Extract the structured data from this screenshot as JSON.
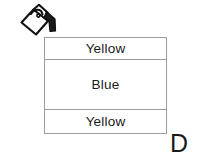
{
  "figure": {
    "label": "D",
    "icon": {
      "name": "paint-bucket-icon",
      "description": "tilted paint bucket pouring"
    },
    "layers": [
      {
        "name": "top-layer",
        "label": "Yellow",
        "color": "#ffffff"
      },
      {
        "name": "middle-layer",
        "label": "Blue",
        "color": "#ffffff"
      },
      {
        "name": "bottom-layer",
        "label": "Yellow",
        "color": "#ffffff"
      }
    ],
    "colors": {
      "background": "#ffffff",
      "border": "#9b9b9b",
      "text": "#1a1a1a",
      "icon_stroke": "#111111"
    }
  }
}
